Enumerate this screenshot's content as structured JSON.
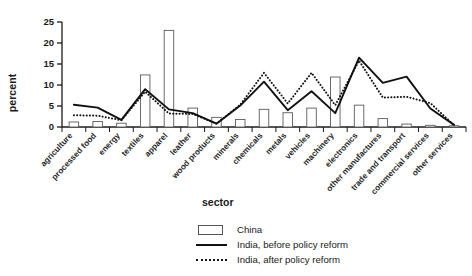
{
  "chart_data": {
    "type": "bar",
    "title": "",
    "subtitle": "",
    "xlabel": "sector",
    "ylabel": "percent",
    "ylim": [
      0,
      25
    ],
    "yticks": [
      0,
      5,
      10,
      15,
      20,
      25
    ],
    "grid": false,
    "legend_position": "bottom-center",
    "categories": [
      "agriculture",
      "processed food",
      "energy",
      "textiles",
      "apparel",
      "leather",
      "wood products",
      "minerals",
      "chemicals",
      "metals",
      "vehicles",
      "machinery",
      "electronics",
      "other manufactures",
      "trade and transport",
      "commercial services",
      "other services"
    ],
    "series": [
      {
        "name": "China",
        "type": "bar",
        "values": [
          1.2,
          1.3,
          0.9,
          12.4,
          23.0,
          4.5,
          2.3,
          1.8,
          4.2,
          3.4,
          4.5,
          11.9,
          5.2,
          2.0,
          0.7,
          0.4,
          0.3
        ]
      },
      {
        "name": "India, before policy reform",
        "type": "line",
        "style": "solid",
        "values": [
          5.3,
          4.6,
          1.7,
          9.0,
          4.2,
          3.3,
          0.8,
          5.1,
          10.8,
          4.0,
          8.5,
          3.3,
          16.5,
          10.5,
          12.0,
          4.4,
          0.5
        ]
      },
      {
        "name": "India, after policy reform",
        "type": "line",
        "style": "dotted",
        "values": [
          2.8,
          2.7,
          1.6,
          8.4,
          3.2,
          3.1,
          0.8,
          5.3,
          12.9,
          5.6,
          12.9,
          5.2,
          15.8,
          7.0,
          7.2,
          5.7,
          0.4
        ]
      }
    ],
    "legend": [
      {
        "label": "China",
        "key": "bar-swatch"
      },
      {
        "label": "India, before policy reform",
        "key": "solid-line"
      },
      {
        "label": "India, after policy reform",
        "key": "dotted-line"
      }
    ]
  }
}
